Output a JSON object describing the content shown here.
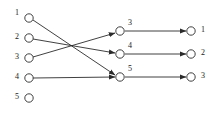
{
  "diagram": {
    "type": "bipartite-flow-graph",
    "title": "",
    "background_color": "#ffffff",
    "stroke_color": "#2b2b2b",
    "node_fill_color": "#ffffff",
    "label_color": "#1a1a1a",
    "columns": [
      {
        "name": "left-column",
        "nodes": [
          {
            "id": "L1",
            "label": "1",
            "cx": 29,
            "cy": 18,
            "r": 4.2,
            "label_x": 15,
            "label_y": 9
          },
          {
            "id": "L2",
            "label": "2",
            "cx": 29,
            "cy": 38,
            "r": 4.2,
            "label_x": 15,
            "label_y": 33
          },
          {
            "id": "L3",
            "label": "3",
            "cx": 29,
            "cy": 58,
            "r": 4.2,
            "label_x": 15,
            "label_y": 53
          },
          {
            "id": "L4",
            "label": "4",
            "cx": 29,
            "cy": 78,
            "r": 4.2,
            "label_x": 15,
            "label_y": 73
          },
          {
            "id": "L5",
            "label": "5",
            "cx": 29,
            "cy": 98,
            "r": 4.2,
            "label_x": 15,
            "label_y": 93
          }
        ]
      },
      {
        "name": "middle-column",
        "nodes": [
          {
            "id": "M3",
            "label": "3",
            "cx": 120,
            "cy": 31,
            "r": 4.2,
            "label_x": 128,
            "label_y": 19
          },
          {
            "id": "M4",
            "label": "4",
            "cx": 120,
            "cy": 54,
            "r": 4.2,
            "label_x": 128,
            "label_y": 42
          },
          {
            "id": "M5",
            "label": "5",
            "cx": 120,
            "cy": 77,
            "r": 4.2,
            "label_x": 128,
            "label_y": 65
          }
        ]
      },
      {
        "name": "right-column",
        "nodes": [
          {
            "id": "R1",
            "label": "1",
            "cx": 191,
            "cy": 31,
            "r": 4.2,
            "label_x": 201,
            "label_y": 26
          },
          {
            "id": "R2",
            "label": "2",
            "cx": 191,
            "cy": 54,
            "r": 4.2,
            "label_x": 201,
            "label_y": 49
          },
          {
            "id": "R3",
            "label": "3",
            "cx": 191,
            "cy": 77,
            "r": 4.2,
            "label_x": 201,
            "label_y": 72
          }
        ]
      }
    ],
    "edges": [
      {
        "id": "E1",
        "from": "L1",
        "to": "M5",
        "x1": 33,
        "y1": 20,
        "x2": 115,
        "y2": 75,
        "arrow": true
      },
      {
        "id": "E2",
        "from": "L2",
        "to": "M4",
        "x1": 33,
        "y1": 39,
        "x2": 115,
        "y2": 53,
        "arrow": true
      },
      {
        "id": "E3",
        "from": "L3",
        "to": "M3",
        "x1": 33,
        "y1": 57,
        "x2": 115,
        "y2": 33,
        "arrow": true
      },
      {
        "id": "E4",
        "from": "L4",
        "to": "M5",
        "x1": 33,
        "y1": 78,
        "x2": 115,
        "y2": 77,
        "arrow": true
      },
      {
        "id": "E5",
        "from": "M3",
        "to": "R1",
        "x1": 125,
        "y1": 31,
        "x2": 186,
        "y2": 31,
        "arrow": true
      },
      {
        "id": "E6",
        "from": "M4",
        "to": "R2",
        "x1": 125,
        "y1": 54,
        "x2": 186,
        "y2": 54,
        "arrow": true
      },
      {
        "id": "E7",
        "from": "M5",
        "to": "R3",
        "x1": 125,
        "y1": 77,
        "x2": 186,
        "y2": 77,
        "arrow": true
      }
    ],
    "isolated_nodes": [
      "L5"
    ]
  }
}
